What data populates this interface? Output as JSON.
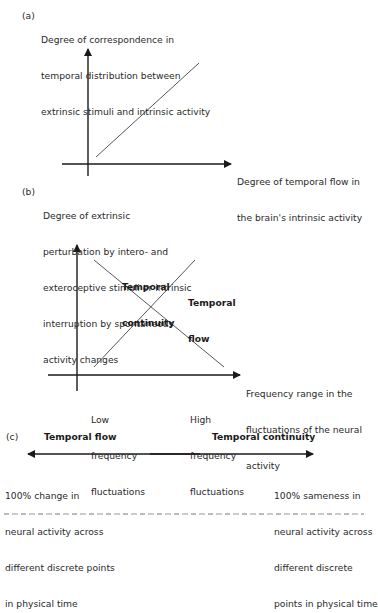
{
  "panel_a": {
    "label": "(a)",
    "y_axis_label": [
      "Degree of correspondence in",
      "temporal distribution between",
      "extrinsic stimuli and intrinsic activity"
    ],
    "x_axis_label": [
      "Degree of temporal flow in",
      "the brain's intrinsic activity"
    ],
    "relationship": "positive linear"
  },
  "panel_b": {
    "label": "(b)",
    "y_axis_label": [
      "Degree of extrinsic",
      "perturbation by intero- and",
      "exteroceptive stimuli or intrinsic",
      "interruption by spontaneous",
      "activity changes"
    ],
    "x_axis_label": [
      "Frequency range in the",
      "fluctuations of the neural",
      "activity"
    ],
    "x_low_label": [
      "Low",
      "frequency",
      "fluctuations"
    ],
    "x_high_label": [
      "High",
      "frequency",
      "fluctuations"
    ],
    "line_continuity_label": [
      "Temporal",
      "continuity"
    ],
    "line_flow_label": [
      "Temporal",
      "flow"
    ]
  },
  "panel_c": {
    "label": "(c)",
    "left_title": "Temporal flow",
    "right_title": "Temporal continuity",
    "left_desc": [
      "100% change in",
      "neural activity across",
      "different discrete points",
      "in physical time"
    ],
    "right_desc": [
      "100% sameness in",
      "neural activity across",
      "different discrete",
      "points in physical time"
    ]
  },
  "colors": {
    "ink": "#1a1a1a",
    "line": "#333333",
    "background": "#ffffff"
  }
}
